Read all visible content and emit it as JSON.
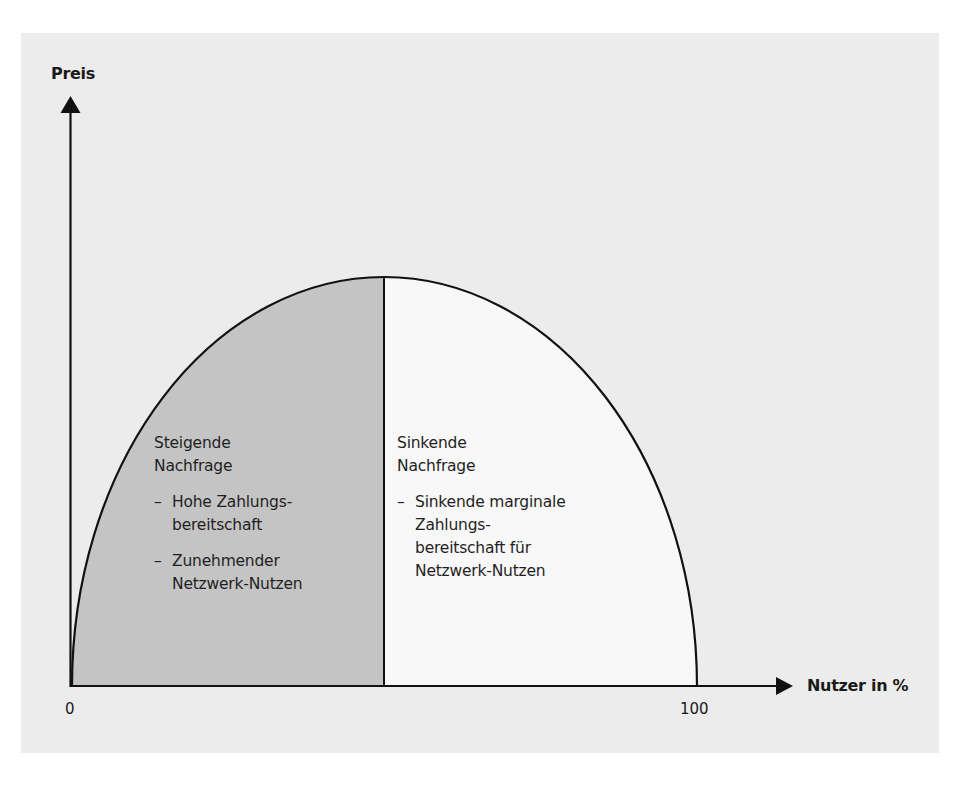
{
  "diagram": {
    "title": "",
    "y_axis": {
      "label": "Preis"
    },
    "x_axis": {
      "label": "Nutzer in %",
      "ticks": [
        "0",
        "100"
      ]
    },
    "colors": {
      "panel_background": "#ececec",
      "shaded_region": "#c4c4c4",
      "unshaded_region": "#f8f8f8",
      "lines": "#111111"
    },
    "left_region": {
      "heading": [
        "Steigende",
        "Nachfrage"
      ],
      "bullets": [
        {
          "dash": "–",
          "lines": [
            "Hohe Zahlungs-",
            "bereitschaft"
          ]
        },
        {
          "dash": "–",
          "lines": [
            "Zunehmender",
            "Netzwerk-Nutzen"
          ]
        }
      ]
    },
    "right_region": {
      "heading": [
        "Sinkende",
        "Nachfrage"
      ],
      "bullets": [
        {
          "dash": "–",
          "lines": [
            "Sinkende marginale",
            "Zahlungs-",
            "bereitschaft für",
            "Netzwerk-Nutzen"
          ]
        }
      ]
    },
    "curve": {
      "shape": "inverted parabola / half-ellipse",
      "start": "0",
      "end": "100",
      "peak_description": "maximum at approx. 50% users, divides rising and falling demand"
    }
  }
}
